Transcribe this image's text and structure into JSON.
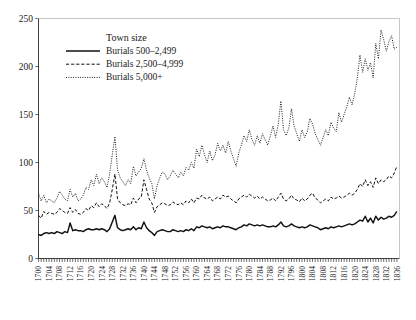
{
  "chart_data": {
    "type": "line",
    "title": "",
    "xlabel": "",
    "ylabel": "",
    "xlim": [
      1700,
      1837
    ],
    "ylim": [
      0,
      250
    ],
    "grid": false,
    "legend_position": "top-left-inside",
    "legend_title": "Town size",
    "ytick_labels": [
      "0",
      "50",
      "100",
      "150",
      "200",
      "250"
    ],
    "ytick_values": [
      0,
      50,
      100,
      150,
      200,
      250
    ],
    "xtick_labels": [
      "1700",
      "1704",
      "1708",
      "1712",
      "1716",
      "1720",
      "1724",
      "1728",
      "1732",
      "1736",
      "1740",
      "1744",
      "1748",
      "1752",
      "1756",
      "1760",
      "1764",
      "1768",
      "1772",
      "1776",
      "1780",
      "1784",
      "1788",
      "1792",
      "1796",
      "1800",
      "1804",
      "1808",
      "1812",
      "1816",
      "1820",
      "1824",
      "1828",
      "1832",
      "1836"
    ],
    "xtick_values": [
      1700,
      1704,
      1708,
      1712,
      1716,
      1720,
      1724,
      1728,
      1732,
      1736,
      1740,
      1744,
      1748,
      1752,
      1756,
      1760,
      1764,
      1768,
      1772,
      1776,
      1780,
      1784,
      1788,
      1792,
      1796,
      1800,
      1804,
      1808,
      1812,
      1816,
      1820,
      1824,
      1828,
      1832,
      1836
    ],
    "x": [
      1700,
      1701,
      1702,
      1703,
      1704,
      1705,
      1706,
      1707,
      1708,
      1709,
      1710,
      1711,
      1712,
      1713,
      1714,
      1715,
      1716,
      1717,
      1718,
      1719,
      1720,
      1721,
      1722,
      1723,
      1724,
      1725,
      1726,
      1727,
      1728,
      1729,
      1730,
      1731,
      1732,
      1733,
      1734,
      1735,
      1736,
      1737,
      1738,
      1739,
      1740,
      1741,
      1742,
      1743,
      1744,
      1745,
      1746,
      1747,
      1748,
      1749,
      1750,
      1751,
      1752,
      1753,
      1754,
      1755,
      1756,
      1757,
      1758,
      1759,
      1760,
      1761,
      1762,
      1763,
      1764,
      1765,
      1766,
      1767,
      1768,
      1769,
      1770,
      1771,
      1772,
      1773,
      1774,
      1775,
      1776,
      1777,
      1778,
      1779,
      1780,
      1781,
      1782,
      1783,
      1784,
      1785,
      1786,
      1787,
      1788,
      1789,
      1790,
      1791,
      1792,
      1793,
      1794,
      1795,
      1796,
      1797,
      1798,
      1799,
      1800,
      1801,
      1802,
      1803,
      1804,
      1805,
      1806,
      1807,
      1808,
      1809,
      1810,
      1811,
      1812,
      1813,
      1814,
      1815,
      1816,
      1817,
      1818,
      1819,
      1820,
      1821,
      1822,
      1823,
      1824,
      1825,
      1826,
      1827,
      1828,
      1829,
      1830,
      1831,
      1832,
      1833,
      1834,
      1835,
      1836
    ],
    "series": [
      {
        "name": "Burials 500–2,499",
        "linestyle": "solid",
        "color": "#111111",
        "values": [
          25,
          24,
          26,
          27,
          26,
          27,
          26,
          28,
          27,
          26,
          28,
          27,
          37,
          29,
          30,
          29,
          29,
          28,
          30,
          31,
          30,
          30,
          31,
          30,
          31,
          30,
          28,
          31,
          38,
          45,
          32,
          30,
          29,
          30,
          31,
          30,
          33,
          30,
          32,
          31,
          38,
          32,
          29,
          27,
          24,
          28,
          29,
          30,
          29,
          28,
          28,
          30,
          29,
          28,
          29,
          28,
          30,
          29,
          31,
          29,
          33,
          32,
          34,
          33,
          32,
          33,
          31,
          32,
          33,
          32,
          34,
          33,
          33,
          32,
          31,
          30,
          32,
          33,
          35,
          34,
          36,
          35,
          34,
          35,
          34,
          35,
          34,
          33,
          33,
          34,
          33,
          35,
          38,
          34,
          33,
          34,
          36,
          34,
          33,
          32,
          33,
          32,
          33,
          35,
          34,
          33,
          32,
          30,
          31,
          32,
          31,
          33,
          32,
          33,
          34,
          33,
          34,
          35,
          36,
          35,
          36,
          38,
          40,
          39,
          44,
          38,
          42,
          37,
          44,
          40,
          43,
          41,
          42,
          44,
          43,
          45,
          49
        ]
      },
      {
        "name": "Burials 2,500–4,999",
        "linestyle": "dashed",
        "color": "#111111",
        "values": [
          45,
          42,
          49,
          46,
          48,
          47,
          46,
          48,
          52,
          50,
          48,
          47,
          53,
          48,
          51,
          47,
          46,
          48,
          52,
          50,
          55,
          53,
          58,
          54,
          57,
          55,
          52,
          58,
          72,
          88,
          62,
          58,
          56,
          55,
          57,
          56,
          63,
          58,
          62,
          64,
          82,
          72,
          62,
          58,
          48,
          54,
          56,
          58,
          57,
          55,
          56,
          59,
          57,
          56,
          58,
          56,
          60,
          58,
          62,
          58,
          63,
          62,
          66,
          63,
          62,
          64,
          60,
          62,
          64,
          62,
          66,
          64,
          65,
          62,
          60,
          58,
          62,
          64,
          66,
          64,
          67,
          65,
          63,
          65,
          62,
          64,
          62,
          60,
          61,
          63,
          60,
          64,
          68,
          62,
          60,
          62,
          66,
          62,
          61,
          59,
          63,
          60,
          62,
          66,
          68,
          63,
          61,
          58,
          60,
          62,
          60,
          64,
          62,
          63,
          65,
          63,
          64,
          66,
          68,
          66,
          68,
          72,
          78,
          75,
          82,
          76,
          80,
          74,
          84,
          78,
          82,
          80,
          82,
          86,
          84,
          89,
          96
        ]
      },
      {
        "name": "Burials 5,000+",
        "linestyle": "dotted",
        "color": "#111111",
        "values": [
          68,
          60,
          66,
          58,
          62,
          60,
          58,
          63,
          70,
          66,
          62,
          60,
          72,
          64,
          68,
          60,
          62,
          66,
          74,
          72,
          82,
          76,
          88,
          78,
          84,
          80,
          74,
          88,
          108,
          127,
          92,
          84,
          80,
          76,
          82,
          78,
          96,
          86,
          90,
          94,
          104,
          92,
          84,
          78,
          62,
          76,
          84,
          90,
          88,
          82,
          86,
          92,
          88,
          84,
          90,
          86,
          95,
          92,
          100,
          94,
          114,
          106,
          118,
          108,
          100,
          112,
          102,
          108,
          120,
          112,
          118,
          110,
          122,
          112,
          104,
          96,
          110,
          118,
          128,
          122,
          134,
          124,
          118,
          128,
          120,
          130,
          124,
          118,
          128,
          138,
          126,
          140,
          164,
          134,
          128,
          136,
          156,
          138,
          130,
          122,
          134,
          126,
          132,
          146,
          140,
          130,
          124,
          118,
          126,
          134,
          128,
          142,
          136,
          132,
          152,
          142,
          150,
          158,
          168,
          160,
          172,
          188,
          212,
          194,
          208,
          196,
          204,
          188,
          224,
          208,
          238,
          228,
          216,
          226,
          232,
          218,
          220
        ]
      }
    ]
  },
  "legend": {
    "title": "Town size",
    "entries": [
      {
        "label": "Burials 500–2,499",
        "style": "solid"
      },
      {
        "label": "Burials 2,500–4,999",
        "style": "dashed"
      },
      {
        "label": "Burials 5,000+",
        "style": "dotted"
      }
    ]
  }
}
